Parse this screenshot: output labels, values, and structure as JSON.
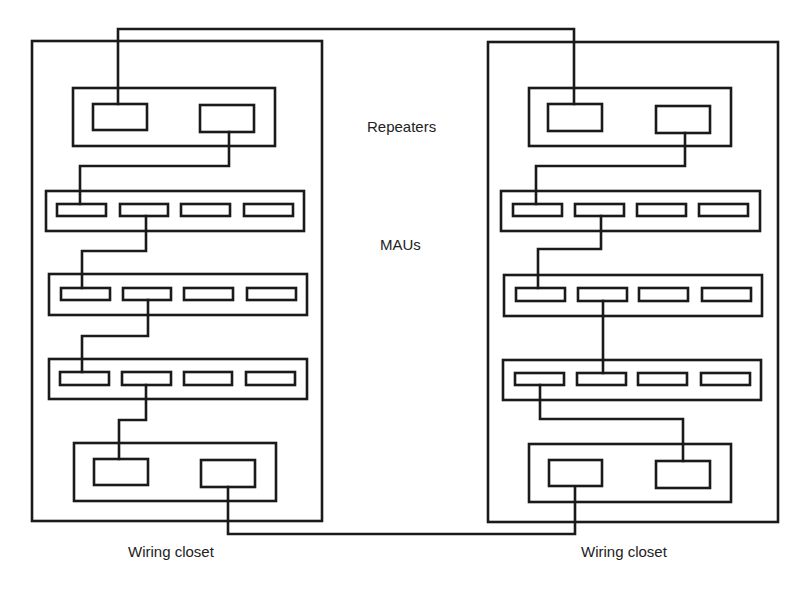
{
  "diagram": {
    "labels": {
      "repeaters": "Repeaters",
      "maus": "MAUs",
      "left_closet": "Wiring closet",
      "right_closet": "Wiring closet"
    },
    "colors": {
      "stroke": "#1a1a1a",
      "background": "#ffffff"
    },
    "closets": [
      {
        "name": "left-wiring-closet",
        "frame": [
          32,
          41,
          290,
          480
        ],
        "top_repeater": {
          "housing": [
            73,
            88,
            202,
            58
          ],
          "units": [
            [
              93,
              104,
              54,
              26
            ],
            [
              200,
              105,
              54,
              27
            ]
          ]
        },
        "maus": [
          {
            "housing": [
              46,
              191,
              258,
              40
            ],
            "ports": [
              [
                57,
                204,
                49,
                12
              ],
              [
                120,
                204,
                48,
                12
              ],
              [
                181,
                204,
                49,
                12
              ],
              [
                244,
                204,
                49,
                12
              ]
            ]
          },
          {
            "housing": [
              49,
              274,
              258,
              41
            ],
            "ports": [
              [
                61,
                288,
                49,
                12
              ],
              [
                123,
                288,
                48,
                12
              ],
              [
                184,
                288,
                49,
                12
              ],
              [
                247,
                288,
                49,
                12
              ]
            ]
          },
          {
            "housing": [
              49,
              359,
              258,
              40
            ],
            "ports": [
              [
                60,
                372,
                49,
                13
              ],
              [
                122,
                372,
                49,
                13
              ],
              [
                184,
                372,
                48,
                13
              ],
              [
                246,
                372,
                49,
                13
              ]
            ]
          }
        ],
        "bottom_repeater": {
          "housing": [
            74,
            443,
            202,
            58
          ],
          "units": [
            [
              94,
              459,
              54,
              26
            ],
            [
              201,
              460,
              54,
              27
            ]
          ]
        }
      },
      {
        "name": "right-wiring-closet",
        "frame": [
          488,
          42,
          290,
          480
        ],
        "top_repeater": {
          "housing": [
            529,
            88,
            202,
            58
          ],
          "units": [
            [
              548,
              104,
              54,
              27
            ],
            [
              656,
              106,
              54,
              27
            ]
          ]
        },
        "maus": [
          {
            "housing": [
              501,
              191,
              259,
              40
            ],
            "ports": [
              [
                513,
                204,
                49,
                12
              ],
              [
                575,
                204,
                49,
                12
              ],
              [
                637,
                204,
                49,
                12
              ],
              [
                699,
                204,
                49,
                12
              ]
            ]
          },
          {
            "housing": [
              504,
              275,
              258,
              41
            ],
            "ports": [
              [
                516,
                288,
                49,
                13
              ],
              [
                578,
                288,
                49,
                13
              ],
              [
                639,
                288,
                49,
                13
              ],
              [
                702,
                288,
                49,
                13
              ]
            ]
          },
          {
            "housing": [
              503,
              360,
              258,
              40
            ],
            "ports": [
              [
                515,
                373,
                49,
                12
              ],
              [
                577,
                373,
                49,
                12
              ],
              [
                638,
                373,
                49,
                12
              ],
              [
                701,
                373,
                49,
                12
              ]
            ]
          }
        ],
        "bottom_repeater": {
          "housing": [
            529,
            444,
            202,
            58
          ],
          "units": [
            [
              549,
              460,
              53,
              26
            ],
            [
              656,
              461,
              54,
              27
            ]
          ]
        }
      }
    ],
    "cables": [
      {
        "name": "top-inter-closet-cable",
        "points": [
          [
            118,
            104
          ],
          [
            118,
            29
          ],
          [
            574,
            29
          ],
          [
            574,
            104
          ]
        ]
      },
      {
        "name": "left-repeater-to-mau1",
        "points": [
          [
            229,
            132
          ],
          [
            229,
            166
          ],
          [
            80,
            166
          ],
          [
            80,
            204
          ]
        ]
      },
      {
        "name": "left-mau1-to-mau2",
        "points": [
          [
            146,
            216
          ],
          [
            146,
            251
          ],
          [
            82,
            251
          ],
          [
            82,
            288
          ]
        ]
      },
      {
        "name": "left-mau2-to-mau3",
        "points": [
          [
            148,
            300
          ],
          [
            148,
            336
          ],
          [
            82,
            336
          ],
          [
            82,
            372
          ]
        ]
      },
      {
        "name": "left-mau3-to-repeater",
        "points": [
          [
            146,
            385
          ],
          [
            146,
            420
          ],
          [
            119,
            420
          ],
          [
            119,
            459
          ]
        ]
      },
      {
        "name": "bottom-inter-closet-cable",
        "points": [
          [
            228,
            487
          ],
          [
            228,
            534
          ],
          [
            575,
            534
          ],
          [
            575,
            487
          ]
        ]
      },
      {
        "name": "right-repeater-to-mau1",
        "points": [
          [
            685,
            133
          ],
          [
            685,
            166
          ],
          [
            536,
            166
          ],
          [
            536,
            204
          ]
        ]
      },
      {
        "name": "right-mau1-to-mau2",
        "points": [
          [
            601,
            216
          ],
          [
            601,
            249
          ],
          [
            538,
            249
          ],
          [
            538,
            288
          ]
        ]
      },
      {
        "name": "right-mau2-to-mau3",
        "points": [
          [
            603,
            301
          ],
          [
            603,
            373
          ]
        ]
      },
      {
        "name": "right-mau3-to-repeater",
        "points": [
          [
            540,
            385
          ],
          [
            540,
            419
          ],
          [
            683,
            419
          ],
          [
            683,
            461
          ]
        ]
      }
    ],
    "label_positions": {
      "repeaters": [
        367,
        132
      ],
      "maus": [
        380,
        250
      ],
      "left_closet": [
        128,
        557
      ],
      "right_closet": [
        581,
        557
      ]
    }
  }
}
